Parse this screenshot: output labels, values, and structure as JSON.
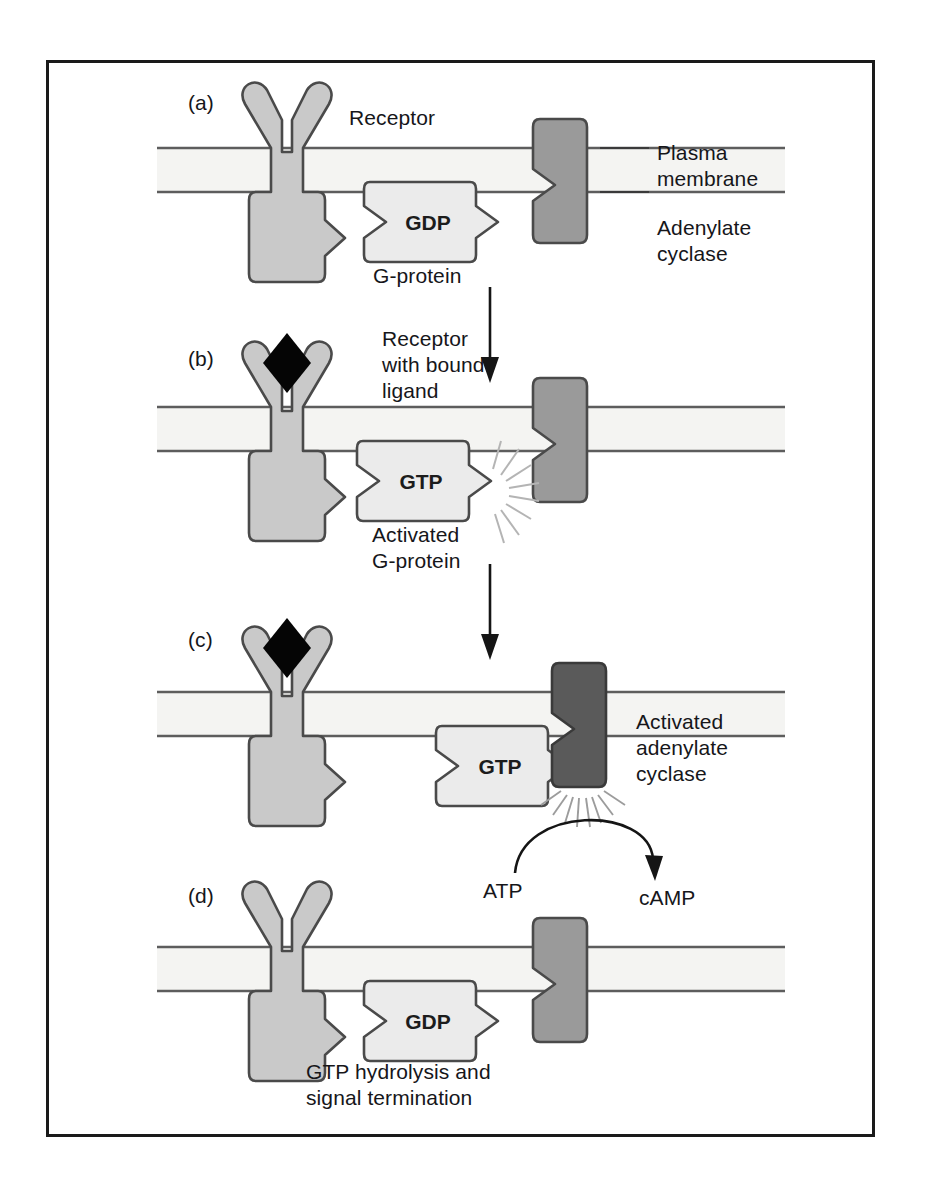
{
  "figure": {
    "type": "biology-pathway-diagram",
    "border_color": "#1a1a1a",
    "background": "#ffffff"
  },
  "palette": {
    "receptor_fill": "#c9c9c9",
    "gprotein_fill": "#ebebeb",
    "cyclase_fill": "#9a9a9a",
    "cyclase_active_fill": "#5a5a5a",
    "membrane_fill": "#f4f4f2",
    "membrane_line": "#5d5d5d",
    "outline": "#4a4a4a",
    "ligand_fill": "#050505",
    "sparkle": "#b4b4b4",
    "text": "#16161a"
  },
  "panels": [
    {
      "id": "a",
      "letter": "(a)",
      "labels": [
        {
          "name": "receptor-label",
          "text": "Receptor"
        },
        {
          "name": "plasma-membrane-label",
          "text": "Plasma\nmembrane"
        },
        {
          "name": "adenylate-cyclase-label",
          "text": "Adenylate\ncyclase"
        },
        {
          "name": "g-protein-label",
          "text": "G-protein"
        }
      ],
      "nucleotide": "GDP",
      "ligand_bound": false,
      "cyclase_activated": false
    },
    {
      "id": "b",
      "letter": "(b)",
      "labels": [
        {
          "name": "receptor-with-ligand-label",
          "text": "Receptor\nwith bound\nligand"
        },
        {
          "name": "activated-g-protein-label",
          "text": "Activated\nG-protein"
        }
      ],
      "nucleotide": "GTP",
      "ligand_bound": true,
      "cyclase_activated": false
    },
    {
      "id": "c",
      "letter": "(c)",
      "labels": [
        {
          "name": "activated-adenylate-cyclase-label",
          "text": "Activated\nadenylate\ncyclase"
        },
        {
          "name": "atp-label",
          "text": "ATP"
        },
        {
          "name": "camp-label",
          "text": "cAMP"
        }
      ],
      "nucleotide": "GTP",
      "ligand_bound": true,
      "cyclase_activated": true
    },
    {
      "id": "d",
      "letter": "(d)",
      "labels": [
        {
          "name": "termination-label",
          "text": "GTP hydrolysis and\nsignal termination"
        }
      ],
      "nucleotide": "GDP",
      "ligand_bound": false,
      "cyclase_activated": false
    }
  ],
  "flow_arrows": [
    {
      "name": "arrow-a-to-b",
      "from_panel": "a",
      "to_panel": "b"
    },
    {
      "name": "arrow-b-to-c",
      "from_panel": "b",
      "to_panel": "c"
    }
  ],
  "reaction": {
    "substrate": "ATP",
    "product": "cAMP",
    "catalyst": "Activated adenylate cyclase"
  }
}
